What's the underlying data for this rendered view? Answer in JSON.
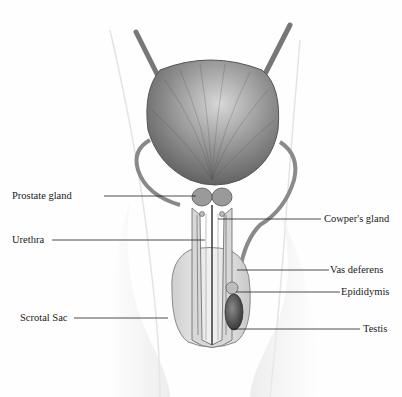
{
  "diagram": {
    "labels": [
      {
        "id": "prostate-gland",
        "text": "Prostate gland",
        "side": "left",
        "x": 12,
        "y": 190,
        "line": [
          104,
          196,
          196,
          196
        ]
      },
      {
        "id": "urethra",
        "text": "Urethra",
        "side": "left",
        "x": 12,
        "y": 234,
        "line": [
          52,
          240,
          205,
          240
        ]
      },
      {
        "id": "scrotal-sac",
        "text": "Scrotal Sac",
        "side": "left",
        "x": 20,
        "y": 312,
        "line": [
          74,
          318,
          168,
          318
        ]
      },
      {
        "id": "cowpers-gland",
        "text": "Cowper's gland",
        "side": "right",
        "x": 324,
        "y": 214,
        "line": [
          218,
          219,
          321,
          219
        ]
      },
      {
        "id": "vas-deferens",
        "text": "Vas deferens",
        "side": "right",
        "x": 330,
        "y": 266,
        "line": [
          237,
          270,
          329,
          270
        ]
      },
      {
        "id": "epididymis",
        "text": "Epididymis",
        "side": "right",
        "x": 341,
        "y": 288,
        "line": [
          236,
          292,
          340,
          292
        ]
      },
      {
        "id": "testis",
        "text": "Testis",
        "side": "right",
        "x": 363,
        "y": 324,
        "line": [
          231,
          329,
          360,
          329
        ]
      }
    ]
  }
}
